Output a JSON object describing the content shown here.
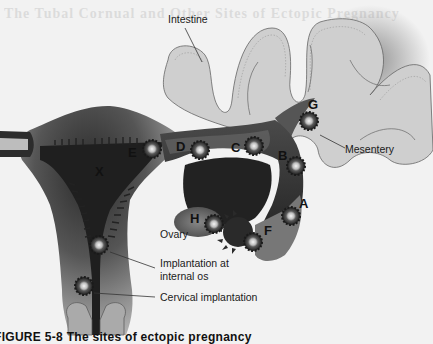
{
  "figure": {
    "background_text_title": "The Tubal Cornual and Other Sites of Ectopic Pregnancy",
    "caption": "FIGURE 5-8 The sites of ectopic pregnancy",
    "colors": {
      "background": "#f2f2f2",
      "intestine_fill": "#cfcfcf",
      "uterus_light": "#bdbdbd",
      "uterus_dark": "#2a2a2a",
      "tube_fill": "#3a3a3a",
      "ovary_fill": "#6a6a6a",
      "implant_dark": "#1e1e1e",
      "implant_center": "#e8e8e8"
    }
  },
  "labels": {
    "intestine": "Intestine",
    "mesentery": "Mesentery",
    "ovary": "Ovary",
    "implantation_internal_os_line1": "Implantation at",
    "implantation_internal_os_line2": "internal os",
    "cervical_implantation": "Cervical implantation"
  },
  "site_letters": {
    "A": "A",
    "B": "B",
    "C": "C",
    "D": "D",
    "E": "E",
    "F": "F",
    "G": "G",
    "H": "H",
    "X": "X"
  }
}
